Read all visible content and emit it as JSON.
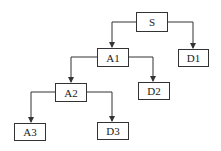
{
  "diagram": {
    "type": "tree",
    "nodes": [
      {
        "id": "S",
        "label": "S",
        "x": 136,
        "y": 12,
        "w": 32,
        "h": 20
      },
      {
        "id": "D1",
        "label": "D1",
        "x": 178,
        "y": 49,
        "w": 31,
        "h": 18
      },
      {
        "id": "A1",
        "label": "A1",
        "x": 97,
        "y": 48,
        "w": 32,
        "h": 19
      },
      {
        "id": "D2",
        "label": "D2",
        "x": 138,
        "y": 82,
        "w": 32,
        "h": 18
      },
      {
        "id": "A2",
        "label": "A2",
        "x": 55,
        "y": 83,
        "w": 32,
        "h": 19
      },
      {
        "id": "A3",
        "label": "A3",
        "x": 14,
        "y": 123,
        "w": 32,
        "h": 18
      },
      {
        "id": "D3",
        "label": "D3",
        "x": 97,
        "y": 122,
        "w": 32,
        "h": 18
      }
    ],
    "edges": [
      {
        "from": "S",
        "to": "A1"
      },
      {
        "from": "S",
        "to": "D1"
      },
      {
        "from": "A1",
        "to": "A2"
      },
      {
        "from": "A1",
        "to": "D2"
      },
      {
        "from": "A2",
        "to": "A3"
      },
      {
        "from": "A2",
        "to": "D3"
      }
    ],
    "line_color": "#333333"
  }
}
